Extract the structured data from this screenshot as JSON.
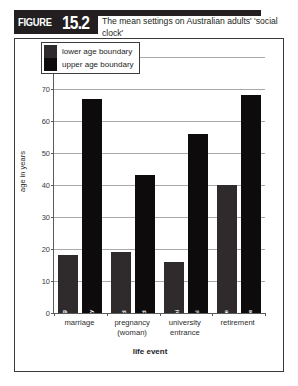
{
  "figure": {
    "badge_word": "FIGURE",
    "badge_number": "15.2",
    "title": "The mean settings on Australian adults' 'social clock'"
  },
  "chart_data": {
    "type": "bar",
    "title": "The mean settings on Australian adults' 'social clock'",
    "xlabel": "life event",
    "ylabel": "age in years",
    "ylim": [
      0,
      80
    ],
    "yticks": [
      0,
      10,
      20,
      30,
      40,
      50,
      60,
      70,
      80
    ],
    "grid": true,
    "legend_position": "top-left",
    "categories": [
      "marriage",
      "pregnancy (woman)",
      "university entrance",
      "retirement"
    ],
    "category_lines": [
      [
        "marriage",
        ""
      ],
      [
        "pregnancy",
        "(woman)"
      ],
      [
        "university",
        "entrance"
      ],
      [
        "retirement",
        ""
      ]
    ],
    "series": [
      {
        "name": "lower age boundary",
        "color": "#2f2b2c",
        "values": [
          18,
          19,
          16,
          40
        ],
        "bar_labels": [
          "too young\nto marry",
          "too young  to\nhave first child",
          "to young\nto enter uni",
          "too young to retire"
        ]
      },
      {
        "name": "upper age boundary",
        "color": "#0d0b0c",
        "values": [
          67,
          43,
          56,
          68
        ],
        "bar_labels": [
          "too old to marry",
          "too old to have first child",
          "too old to enter uni",
          "too old to remain in the workforce"
        ]
      }
    ],
    "legend": [
      "lower age boundary",
      "upper age boundary"
    ]
  }
}
